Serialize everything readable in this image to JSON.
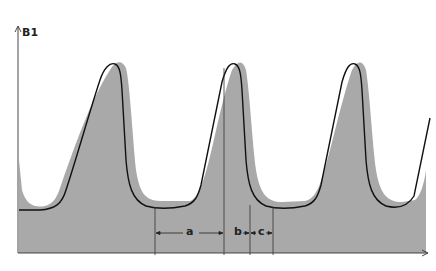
{
  "diagram": {
    "y_axis_label": "B1",
    "dimension_labels": {
      "a": "a",
      "b": "b",
      "c": "c"
    },
    "colors": {
      "fill_waveform": "#a9a9a9",
      "outline_waveform": "#111111",
      "axis": "#333333",
      "background": "#ffffff"
    },
    "cycles": 3
  }
}
